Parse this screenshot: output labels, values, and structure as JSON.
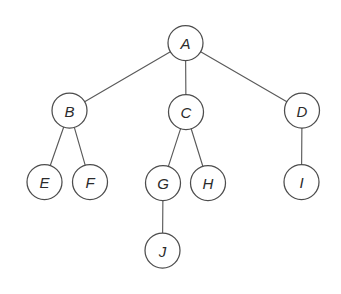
{
  "diagram": {
    "type": "tree",
    "background_color": "#ffffff",
    "node_fill_color": "#ffffff",
    "node_stroke_color": "#4d4d4d",
    "edge_stroke_color": "#5a5a5a",
    "label_color": "#2b2b2b",
    "node_radius": 17.5,
    "root": "A",
    "nodes": [
      {
        "id": "A",
        "label": "A",
        "cx": 185.5,
        "cy": 43.0,
        "r": 17.5,
        "level": 0
      },
      {
        "id": "B",
        "label": "B",
        "cx": 69.5,
        "cy": 110.5,
        "r": 17.5,
        "level": 1
      },
      {
        "id": "C",
        "label": "C",
        "cx": 186.0,
        "cy": 112.0,
        "r": 17.5,
        "level": 1
      },
      {
        "id": "D",
        "label": "D",
        "cx": 302.0,
        "cy": 110.5,
        "r": 17.5,
        "level": 1
      },
      {
        "id": "E",
        "label": "E",
        "cx": 44.5,
        "cy": 182.0,
        "r": 17.5,
        "level": 2
      },
      {
        "id": "F",
        "label": "F",
        "cx": 90.0,
        "cy": 182.0,
        "r": 17.5,
        "level": 2
      },
      {
        "id": "G",
        "label": "G",
        "cx": 163.0,
        "cy": 183.0,
        "r": 17.5,
        "level": 2
      },
      {
        "id": "H",
        "label": "H",
        "cx": 208.0,
        "cy": 183.0,
        "r": 17.5,
        "level": 2
      },
      {
        "id": "I",
        "label": "I",
        "cx": 301.5,
        "cy": 182.0,
        "r": 17.5,
        "level": 2
      },
      {
        "id": "J",
        "label": "J",
        "cx": 162.5,
        "cy": 250.5,
        "r": 17.5,
        "level": 3
      }
    ],
    "edges": [
      {
        "from": "A",
        "to": "B"
      },
      {
        "from": "A",
        "to": "C"
      },
      {
        "from": "A",
        "to": "D"
      },
      {
        "from": "B",
        "to": "E"
      },
      {
        "from": "B",
        "to": "F"
      },
      {
        "from": "C",
        "to": "G"
      },
      {
        "from": "C",
        "to": "H"
      },
      {
        "from": "D",
        "to": "I"
      },
      {
        "from": "G",
        "to": "J"
      }
    ]
  }
}
